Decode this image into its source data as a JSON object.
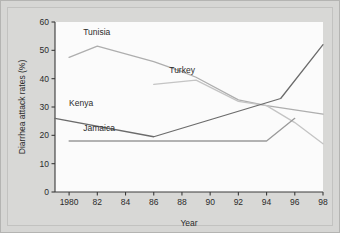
{
  "chart_data": {
    "type": "line",
    "title": "",
    "xlabel": "Year",
    "ylabel": "Diarrhea attack rates (%)",
    "xlim": [
      1979,
      1998
    ],
    "ylim": [
      0,
      60
    ],
    "yticks": [
      0,
      10,
      20,
      30,
      40,
      50,
      60
    ],
    "ytick_labels": [
      "0",
      "10",
      "20",
      "30",
      "40",
      "50",
      "60"
    ],
    "xticks": [
      1980,
      1982,
      1984,
      1986,
      1988,
      1990,
      1992,
      1994,
      1996,
      1998
    ],
    "xtick_labels": [
      "1980",
      "82",
      "84",
      "86",
      "88",
      "90",
      "92",
      "94",
      "96",
      "98"
    ],
    "grid": false,
    "legend_position": "inline-labels",
    "series": [
      {
        "name": "Tunisia",
        "color": "#aeaeae",
        "label_x": 1981.0,
        "label_y": 55.5,
        "x": [
          1980,
          1982,
          1986,
          1988,
          1989,
          1992,
          1994,
          1996,
          1998
        ],
        "values": [
          47.5,
          51.5,
          46.0,
          42.5,
          40.5,
          32.5,
          30.5,
          29.0,
          27.5
        ]
      },
      {
        "name": "Turkey",
        "color": "#c4c4c4",
        "label_x": 1987.1,
        "label_y": 42.0,
        "x": [
          1986,
          1989,
          1992,
          1994,
          1996,
          1998
        ],
        "values": [
          38.0,
          39.5,
          32.0,
          30.5,
          24.5,
          17.0
        ]
      },
      {
        "name": "Kenya",
        "color": "#6b6b6b",
        "label_x": 1980.0,
        "label_y": 30.5,
        "x": [
          1979,
          1986,
          1990,
          1995,
          1998
        ],
        "values": [
          26.0,
          19.5,
          25.5,
          33.0,
          52.0
        ]
      },
      {
        "name": "Jamaica",
        "color": "#9a9a9a",
        "label_x": 1981.0,
        "label_y": 21.5,
        "x": [
          1980,
          1994,
          1996
        ],
        "values": [
          18.0,
          18.0,
          26.0
        ]
      }
    ]
  }
}
